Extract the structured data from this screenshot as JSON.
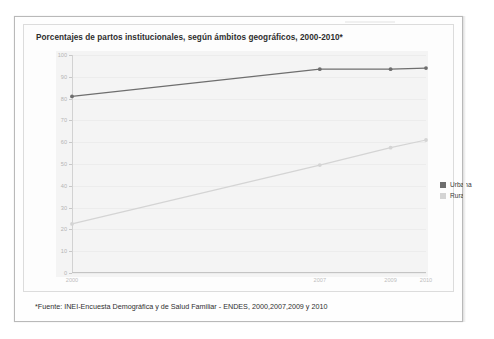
{
  "document": {
    "source_note": "*Fuente: INEI-Encuesta Demográfica y de Salud Familiar - ENDES, 2000,2007,2009 y 2010"
  },
  "chart_data": {
    "type": "line",
    "title": "Porcentajes de partos institucionales, según ámbitos geográficos, 2000-2010*",
    "xlabel": "",
    "ylabel": "",
    "categories": [
      "2000",
      "2007",
      "2009",
      "2010"
    ],
    "x": [
      2000,
      2007,
      2009,
      2010
    ],
    "ylim": [
      0,
      100
    ],
    "yticks": [
      0,
      10,
      20,
      30,
      40,
      50,
      60,
      70,
      80,
      90,
      100
    ],
    "grid": true,
    "legend_position": "right",
    "series": [
      {
        "name": "Urbana",
        "color": "#6e6e6e",
        "values": [
          81,
          93.5,
          93.5,
          94
        ]
      },
      {
        "name": "Rural",
        "color": "#d4d4d4",
        "values": [
          22.5,
          49.5,
          57.5,
          61
        ]
      }
    ]
  }
}
